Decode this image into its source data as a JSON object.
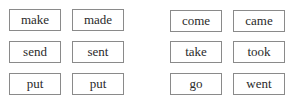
{
  "groups": [
    {
      "pairs": [
        {
          "present": "make",
          "past": "made"
        },
        {
          "present": "send",
          "past": "sent"
        },
        {
          "present": "put",
          "past": "put"
        }
      ]
    },
    {
      "pairs": [
        {
          "present": "come",
          "past": "came"
        },
        {
          "present": "take",
          "past": "took"
        },
        {
          "present": "go",
          "past": "went"
        }
      ]
    }
  ]
}
